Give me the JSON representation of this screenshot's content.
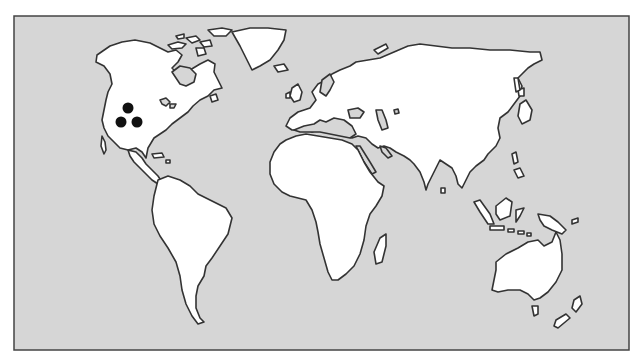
{
  "map": {
    "type": "world-outline",
    "projection": "simplified equirectangular",
    "colors": {
      "ocean": "#d6d6d6",
      "land": "#ffffff",
      "coastline": "#333333",
      "frame": "#444444",
      "marker": "#111111",
      "page_background": "#ffffff"
    },
    "frame": {
      "x": 14,
      "y": 16,
      "width": 615,
      "height": 334
    },
    "markers": [
      {
        "id": "marker-1",
        "region": "western North America",
        "x": 128,
        "y": 108,
        "r": 5.5
      },
      {
        "id": "marker-2",
        "region": "western North America",
        "x": 121,
        "y": 122,
        "r": 5.5
      },
      {
        "id": "marker-3",
        "region": "western North America",
        "x": 137,
        "y": 122,
        "r": 5.5
      }
    ]
  }
}
